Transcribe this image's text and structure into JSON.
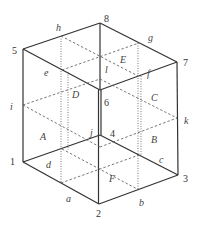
{
  "diagram": {
    "vertices": [
      {
        "label": "1",
        "x": 23,
        "y": 162
      },
      {
        "label": "2",
        "x": 99,
        "y": 204
      },
      {
        "label": "3",
        "x": 178,
        "y": 175
      },
      {
        "label": "4",
        "x": 100,
        "y": 135
      },
      {
        "label": "5",
        "x": 23,
        "y": 49
      },
      {
        "label": "6",
        "x": 100,
        "y": 90
      },
      {
        "label": "7",
        "x": 177,
        "y": 62
      },
      {
        "label": "8",
        "x": 100,
        "y": 23
      }
    ],
    "vertex_labels": {
      "v1": "1",
      "v2": "2",
      "v3": "3",
      "v4": "4",
      "v5": "5",
      "v6": "6",
      "v7": "7",
      "v8": "8"
    },
    "edge_labels": {
      "a": "a",
      "b": "b",
      "c": "c",
      "d": "d",
      "e": "e",
      "f": "f",
      "g": "g",
      "h": "h",
      "i": "i",
      "j": "j",
      "k": "k",
      "l": "l"
    },
    "face_labels": {
      "A": "A",
      "B": "B",
      "C": "C",
      "D": "D",
      "E": "E",
      "F": "F"
    }
  }
}
